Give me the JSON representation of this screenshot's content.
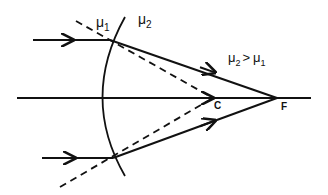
{
  "diagram": {
    "type": "optics-refraction-convex-surface",
    "labels": {
      "medium1": "μ",
      "medium1_sub": "1",
      "medium2": "μ",
      "medium2_sub": "2",
      "condition_a": "μ",
      "condition_a_sub": "2",
      "condition_op": ">",
      "condition_b": "μ",
      "condition_b_sub": "1",
      "center": "C",
      "focus": "F"
    },
    "colors": {
      "line": "#111111",
      "background": "#ffffff"
    },
    "points": {
      "C": [
        213,
        98
      ],
      "F": [
        277,
        98
      ],
      "upper_incidence": [
        110,
        40
      ],
      "lower_incidence": [
        113,
        158
      ]
    }
  }
}
